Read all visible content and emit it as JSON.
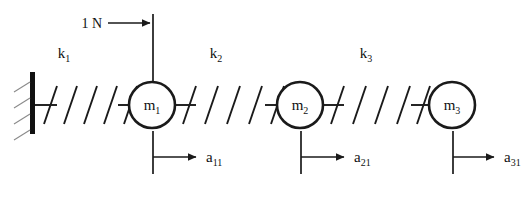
{
  "figure": {
    "type": "mechanical-schematic",
    "background_color": "#ffffff",
    "line_color": "#1a1a1a",
    "hatch_color": "#8a8a8a"
  },
  "wall": {
    "name": "fixed-support",
    "hatch_count": 4
  },
  "force": {
    "label": "1 N",
    "direction": "right",
    "applied_to": "m_1"
  },
  "springs": [
    {
      "label": "k",
      "subscript": "1",
      "from": "wall",
      "to": "m_1"
    },
    {
      "label": "k",
      "subscript": "2",
      "from": "m_1",
      "to": "m_2"
    },
    {
      "label": "k",
      "subscript": "3",
      "from": "m_2",
      "to": "m_3"
    }
  ],
  "masses": [
    {
      "label": "m",
      "subscript": "1"
    },
    {
      "label": "m",
      "subscript": "2"
    },
    {
      "label": "m",
      "subscript": "3"
    }
  ],
  "accelerations": [
    {
      "label": "a",
      "subscript": "11",
      "direction": "right"
    },
    {
      "label": "a",
      "subscript": "21",
      "direction": "right"
    },
    {
      "label": "a",
      "subscript": "31",
      "direction": "right"
    }
  ]
}
